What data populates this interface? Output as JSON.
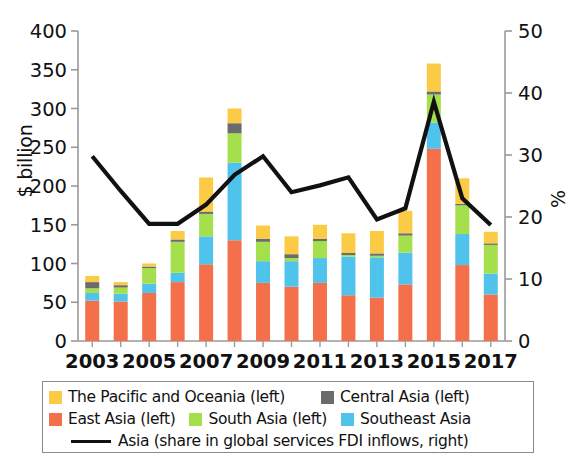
{
  "axes": {
    "left_title": "$ billion",
    "right_title": "%",
    "left_ticks": [
      "0",
      "50",
      "100",
      "150",
      "200",
      "250",
      "300",
      "350",
      "400"
    ],
    "right_ticks": [
      "0",
      "10",
      "20",
      "30",
      "40",
      "50"
    ],
    "x_ticks": [
      "2003",
      "2005",
      "2007",
      "2009",
      "2011",
      "2013",
      "2015",
      "2017"
    ]
  },
  "title_fragment": "g",
  "legend": {
    "items": [
      {
        "label": "The Pacific and Oceania (left)",
        "color": "#FBCB45",
        "type": "swatch"
      },
      {
        "label": "Central Asia (left)",
        "color": "#6B6B6B",
        "type": "swatch"
      },
      {
        "label": "East Asia (left)",
        "color": "#F4704A",
        "type": "swatch"
      },
      {
        "label": "South Asia (left)",
        "color": "#A5E04C",
        "type": "swatch"
      },
      {
        "label": "Southeast Asia",
        "color": "#4FC3EB",
        "type": "swatch"
      },
      {
        "label": "Asia (share in global services FDI inflows, right)",
        "color": "#111111",
        "type": "line"
      }
    ]
  },
  "chart_data": {
    "type": "bar",
    "title": "",
    "xlabel": "",
    "ylabel": "$ billion",
    "y2label": "%",
    "ylim": [
      0,
      400
    ],
    "y2lim": [
      0,
      50
    ],
    "grid": false,
    "legend_position": "bottom",
    "stacked": true,
    "categories": [
      "2003",
      "2004",
      "2005",
      "2006",
      "2007",
      "2008",
      "2009",
      "2010",
      "2011",
      "2012",
      "2013",
      "2014",
      "2015",
      "2016",
      "2017"
    ],
    "series": [
      {
        "name": "East Asia (left)",
        "color": "#F4704A",
        "axis": "left",
        "values": [
          52,
          51,
          62,
          76,
          99,
          130,
          75,
          70,
          75,
          59,
          56,
          73,
          248,
          98,
          60
        ]
      },
      {
        "name": "Southeast Asia",
        "color": "#4FC3EB",
        "axis": "left",
        "values": [
          10,
          10,
          12,
          12,
          36,
          100,
          28,
          33,
          32,
          50,
          52,
          41,
          34,
          40,
          27
        ]
      },
      {
        "name": "South Asia (left)",
        "color": "#A5E04C",
        "axis": "left",
        "values": [
          6,
          8,
          20,
          40,
          29,
          38,
          25,
          4,
          22,
          2,
          2,
          22,
          36,
          37,
          37
        ]
      },
      {
        "name": "Central Asia (left)",
        "color": "#6B6B6B",
        "axis": "left",
        "values": [
          8,
          3,
          2,
          3,
          3,
          13,
          4,
          5,
          3,
          3,
          3,
          3,
          4,
          2,
          2
        ]
      },
      {
        "name": "The Pacific and Oceania (left)",
        "color": "#FBCB45",
        "axis": "left",
        "values": [
          8,
          4,
          4,
          11,
          44,
          19,
          17,
          23,
          18,
          25,
          29,
          29,
          36,
          33,
          15
        ]
      }
    ],
    "line": {
      "name": "Asia (share in global services FDI inflows, right)",
      "color": "#111111",
      "axis": "right",
      "values": [
        29.8,
        24.2,
        18.9,
        18.9,
        22.0,
        26.8,
        29.8,
        24.0,
        25.1,
        26.4,
        19.6,
        21.4,
        38.6,
        23.0,
        18.7
      ]
    }
  }
}
